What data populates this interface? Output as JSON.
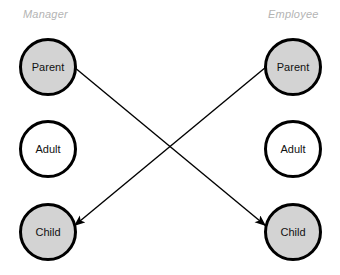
{
  "diagram": {
    "title_visible": false,
    "background_color": "#ffffff",
    "node_border_color": "#000000",
    "node_shaded_fill": "#d3d3d3",
    "node_plain_fill": "#ffffff",
    "label_color": "#b4b4b4",
    "arrow_color": "#000000",
    "columns": [
      {
        "id": "manager",
        "label": "Manager",
        "nodes": [
          {
            "id": "manager-parent",
            "label": "Parent",
            "state": "shaded"
          },
          {
            "id": "manager-adult",
            "label": "Adult",
            "state": "plain"
          },
          {
            "id": "manager-child",
            "label": "Child",
            "state": "shaded"
          }
        ]
      },
      {
        "id": "employee",
        "label": "Employee",
        "nodes": [
          {
            "id": "employee-parent",
            "label": "Parent",
            "state": "shaded"
          },
          {
            "id": "employee-adult",
            "label": "Adult",
            "state": "plain"
          },
          {
            "id": "employee-child",
            "label": "Child",
            "state": "shaded"
          }
        ]
      }
    ],
    "arrows": [
      {
        "id": "manager-parent-to-employee-child",
        "from": "manager-parent",
        "to": "employee-child"
      },
      {
        "id": "employee-parent-to-manager-child",
        "from": "employee-parent",
        "to": "manager-child"
      }
    ]
  }
}
